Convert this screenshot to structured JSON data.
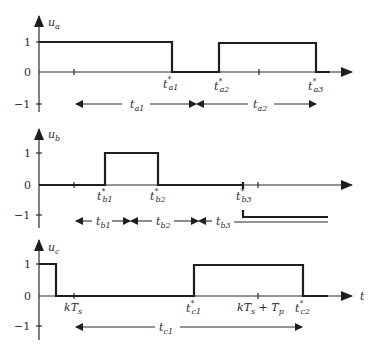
{
  "diagram": {
    "panels": [
      {
        "id": "a",
        "ylabel": "u",
        "ylabel_sub": "a",
        "yticks": [
          "1",
          "0",
          "−1"
        ],
        "events": [
          {
            "label": "t",
            "sup": "*",
            "sub": "a1"
          },
          {
            "label": "t",
            "sup": "*",
            "sub": "a2"
          },
          {
            "label": "t",
            "sup": "*",
            "sub": "a3"
          }
        ],
        "intervals": [
          {
            "label": "t",
            "sub": "a1"
          },
          {
            "label": "t",
            "sub": "a2"
          }
        ]
      },
      {
        "id": "b",
        "ylabel": "u",
        "ylabel_sub": "b",
        "yticks": [
          "1",
          "0",
          "−1"
        ],
        "events": [
          {
            "label": "t",
            "sup": "*",
            "sub": "b1"
          },
          {
            "label": "t",
            "sup": "*",
            "sub": "b2"
          },
          {
            "label": "t",
            "sup": "*",
            "sub": "b3"
          }
        ],
        "intervals": [
          {
            "label": "t",
            "sub": "b1"
          },
          {
            "label": "t",
            "sub": "b2"
          },
          {
            "label": "t",
            "sub": "b3"
          }
        ]
      },
      {
        "id": "c",
        "ylabel": "u",
        "ylabel_sub": "c",
        "yticks": [
          "1",
          "0",
          "−1"
        ],
        "xaxis_label": "t",
        "marks": [
          {
            "label": "kT",
            "sub": "s"
          },
          {
            "label": "kT",
            "sub": "s",
            "suffix": " + T",
            "suffix_sub": "p"
          }
        ],
        "events": [
          {
            "label": "t",
            "sup": "*",
            "sub": "c1"
          },
          {
            "label": "t",
            "sup": "*",
            "sub": "c2"
          }
        ],
        "intervals": [
          {
            "label": "t",
            "sub": "c1"
          }
        ]
      }
    ]
  }
}
